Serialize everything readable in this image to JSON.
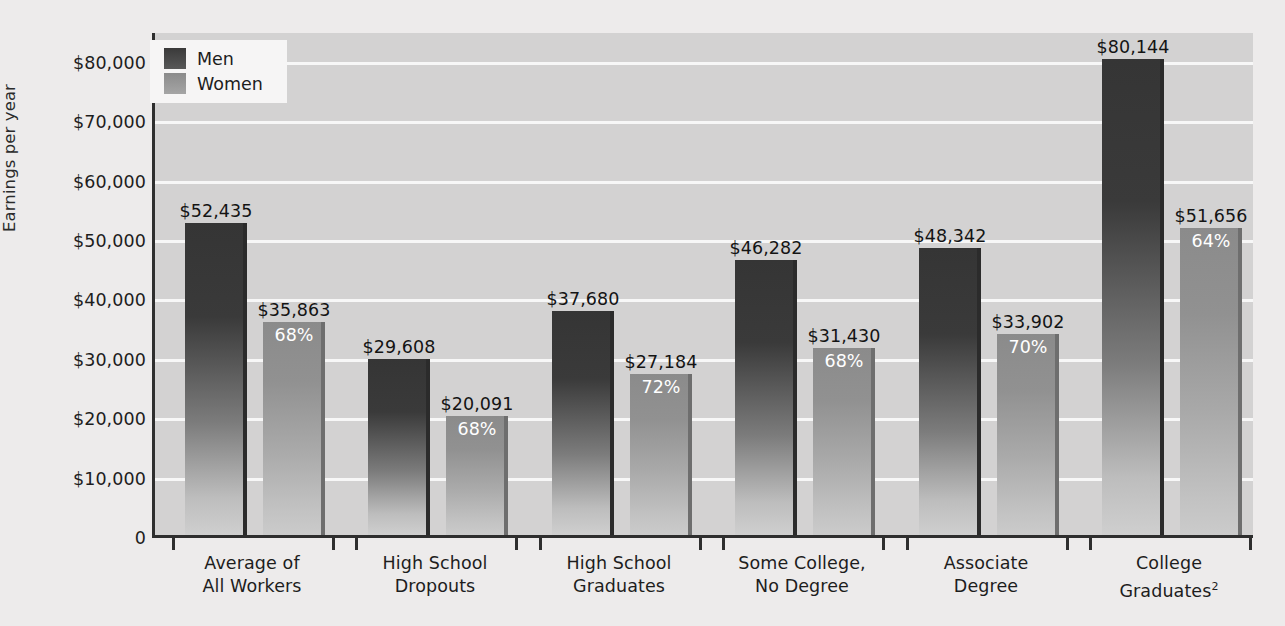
{
  "chart_data": {
    "type": "bar",
    "title": "",
    "xlabel": "",
    "ylabel": "Earnings per year",
    "ylim": [
      0,
      85000
    ],
    "grid": true,
    "legend_position": "top-left",
    "categories": [
      "Average of\nAll Workers",
      "High School\nDropouts",
      "High School\nGraduates",
      "Some College,\nNo Degree",
      "Associate\nDegree",
      "College\nGraduates"
    ],
    "ytick_labels": [
      "$80,000",
      "$70,000",
      "$60,000",
      "$50,000",
      "$40,000",
      "$30,000",
      "$20,000",
      "$10,000",
      "0"
    ],
    "ytick_values": [
      80000,
      70000,
      60000,
      50000,
      40000,
      30000,
      20000,
      10000,
      0
    ],
    "series": [
      {
        "name": "Men",
        "color": "#3a3a3a",
        "values": [
          52435,
          29608,
          37680,
          46282,
          48342,
          80144
        ],
        "labels": [
          "$52,435",
          "$29,608",
          "$37,680",
          "$46,282",
          "$48,342",
          "$80,144"
        ]
      },
      {
        "name": "Women",
        "color": "#8b8b8b",
        "values": [
          35863,
          20091,
          27184,
          31430,
          33902,
          51656
        ],
        "labels": [
          "$35,863",
          "$20,091",
          "$27,184",
          "$31,430",
          "$33,902",
          "$51,656"
        ],
        "ratio_labels": [
          "68%",
          "68%",
          "72%",
          "68%",
          "70%",
          "64%"
        ]
      }
    ]
  },
  "categories_display": [
    {
      "line1": "Average of",
      "line2": "All Workers",
      "sup": ""
    },
    {
      "line1": "High School",
      "line2": "Dropouts",
      "sup": ""
    },
    {
      "line1": "High School",
      "line2": "Graduates",
      "sup": ""
    },
    {
      "line1": "Some College,",
      "line2": "No Degree",
      "sup": ""
    },
    {
      "line1": "Associate",
      "line2": "Degree",
      "sup": ""
    },
    {
      "line1": "College",
      "line2": "Graduates",
      "sup": "2"
    }
  ],
  "legend": {
    "items": [
      {
        "label": "Men"
      },
      {
        "label": "Women"
      }
    ]
  },
  "axis": {
    "y_title": "Earnings per year"
  }
}
